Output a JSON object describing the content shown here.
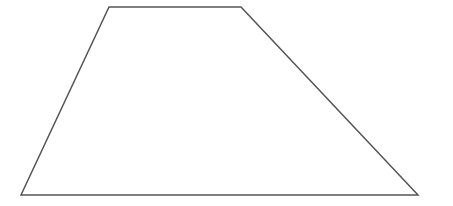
{
  "canvas": {
    "width": 453,
    "height": 206,
    "background": "#ffffff"
  },
  "shape": {
    "type": "trapezoid",
    "stroke_color": "#555555",
    "stroke_width": 1.5,
    "fill": "none",
    "vertices": [
      {
        "name": "top-left",
        "x": 109,
        "y": 7
      },
      {
        "name": "top-right",
        "x": 241,
        "y": 7
      },
      {
        "name": "bottom-right",
        "x": 418,
        "y": 195
      },
      {
        "name": "bottom-left",
        "x": 21,
        "y": 195
      }
    ],
    "points": "109,7 241,7 418,195 21,195"
  }
}
